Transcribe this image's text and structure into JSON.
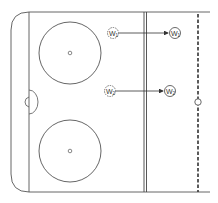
{
  "diagram": {
    "type": "hockey-rink-drill",
    "colors": {
      "lines": "#555555",
      "background": "#ffffff",
      "markers": "#444444"
    },
    "players": [
      {
        "label": "W",
        "subscript": "1",
        "start": "dashed-circle",
        "end": "solid-circle"
      },
      {
        "label": "W",
        "subscript": "2",
        "start": "dashed-circle",
        "end": "solid-circle"
      }
    ],
    "elements": [
      "end-boards",
      "goal-line",
      "goal-crease",
      "faceoff-circle-top",
      "faceoff-circle-bottom",
      "blue-line",
      "center-line-dashed",
      "center-faceoff-dot"
    ]
  }
}
